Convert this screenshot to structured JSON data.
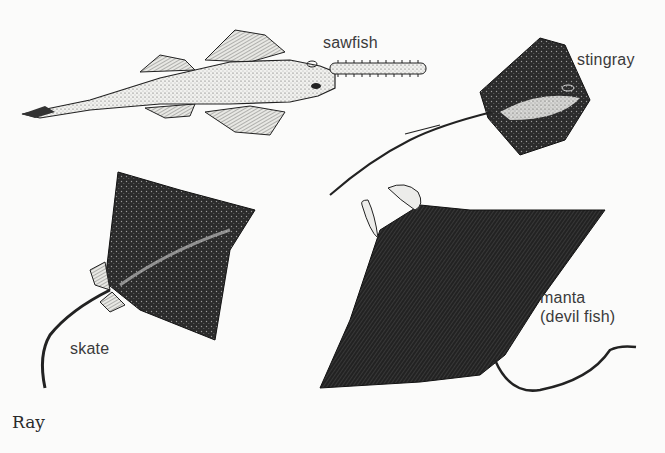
{
  "figure": {
    "caption": "Ray",
    "background_color": "#fbfbfa",
    "ink_color": "#1a1a1a",
    "specimens": [
      {
        "id": "sawfish",
        "label": "sawfish"
      },
      {
        "id": "stingray",
        "label": "stingray"
      },
      {
        "id": "skate",
        "label": "skate"
      },
      {
        "id": "manta",
        "label_line1": "manta",
        "label_line2": "(devil fish)"
      }
    ]
  }
}
